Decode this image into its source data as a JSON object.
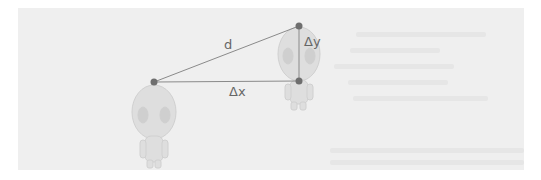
{
  "diagram": {
    "labels": {
      "distance": "d",
      "delta_x": "Δx",
      "delta_y": "Δy"
    },
    "points": {
      "alien_a": {
        "x": 154,
        "y": 82
      },
      "alien_b_head": {
        "x": 299,
        "y": 26
      },
      "alien_b_corner": {
        "x": 299,
        "y": 81
      }
    },
    "colors": {
      "panel_bg": "#efefef",
      "line": "#8a8a8a",
      "point": "#6e6e6e",
      "alien": "#d9d9d9"
    }
  }
}
